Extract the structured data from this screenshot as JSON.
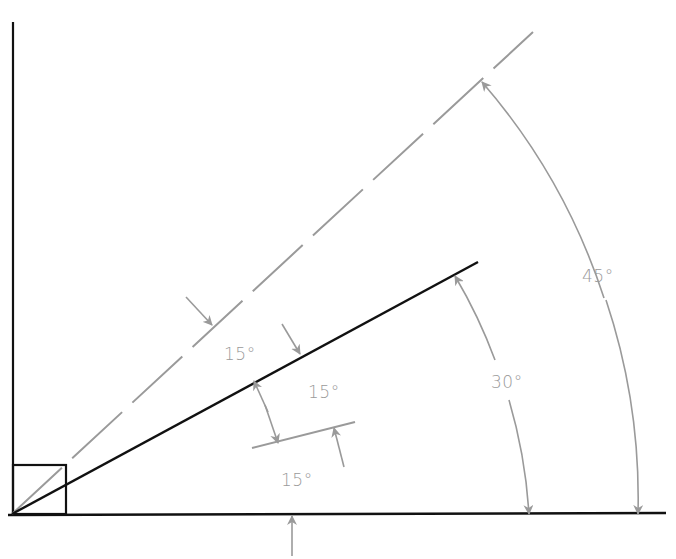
{
  "diagram": {
    "type": "angle-construction",
    "colors": {
      "ink": "#111111",
      "dimension": "#9a9a9a",
      "background": "#ffffff"
    },
    "labels": {
      "angle_45": "45°",
      "angle_30": "30°",
      "angle_15_upper": "15°",
      "angle_15_middle": "15°",
      "angle_15_lower": "15°"
    },
    "elements": [
      {
        "name": "vertical-reference-line",
        "style": "solid",
        "color": "ink"
      },
      {
        "name": "horizontal-baseline",
        "style": "solid",
        "color": "ink"
      },
      {
        "name": "right-angle-square",
        "style": "solid",
        "color": "ink"
      },
      {
        "name": "line-45-degrees",
        "style": "dashed",
        "color": "dimension"
      },
      {
        "name": "line-30-degrees",
        "style": "solid",
        "color": "ink"
      },
      {
        "name": "line-15-degrees",
        "style": "solid",
        "color": "dimension"
      }
    ],
    "dimensions": [
      {
        "name": "arc-45",
        "label_ref": "angle_45",
        "from": "baseline",
        "to": "line-45-degrees"
      },
      {
        "name": "arc-30",
        "label_ref": "angle_30",
        "from": "baseline",
        "to": "line-30-degrees"
      },
      {
        "name": "span-15-between-45-and-30",
        "label_ref": "angle_15_upper"
      },
      {
        "name": "span-15-between-30-and-15",
        "label_ref": "angle_15_middle"
      },
      {
        "name": "span-15-between-15-and-baseline",
        "label_ref": "angle_15_lower"
      }
    ]
  }
}
